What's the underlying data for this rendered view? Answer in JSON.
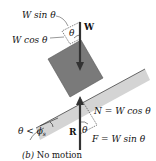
{
  "diagram": {
    "labels": {
      "w_sin": "W sin θ",
      "w_cos": "W cos θ",
      "w": "W",
      "theta_top": "θ",
      "normal": "N = W cos θ",
      "r": "R",
      "theta_bottom": "θ",
      "friction": "F = W sin θ",
      "incline_angle": "θ < ϕ",
      "incline_angle_sub": "s"
    },
    "caption": {
      "letter": "(b)",
      "text": " No motion"
    },
    "colors": {
      "block": "#7a7a7a",
      "incline_shade": "#d4d4d4",
      "arrow": "#333333",
      "text": "#111111"
    }
  }
}
